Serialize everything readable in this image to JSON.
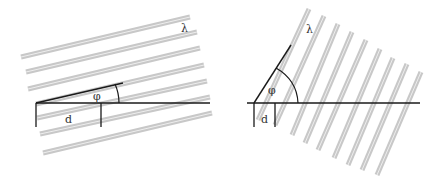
{
  "colors": {
    "stripe": "#c8c8c8",
    "stripe_center": "#e6e6e6",
    "line": "#1a1a1a",
    "background": "#ffffff"
  },
  "left_diagram": {
    "labels": {
      "wavelength": "λ",
      "angle": "φ",
      "spacing": "d"
    },
    "stripe_count": 7,
    "stripe_angle_deg": -13
  },
  "right_diagram": {
    "labels": {
      "wavelength": "λ",
      "angle": "φ",
      "spacing": "d"
    },
    "stripe_count": 9,
    "stripe_angle_deg": -57
  }
}
